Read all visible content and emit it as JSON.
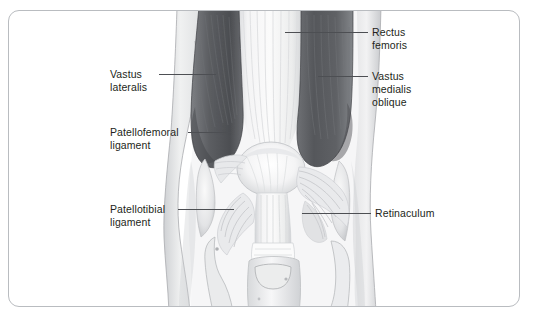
{
  "figure": {
    "kind": "anatomy-illustration",
    "frame_border_color": "#b9bcc0",
    "background_color": "#ffffff",
    "label_text_color": "#231f20",
    "leader_line_color": "#4d4f53",
    "muscle_dark_color": "#5e6064",
    "muscle_mid_color": "#8e9195",
    "tendon_light_color": "#f2f2f2",
    "shade_color": "#c8cacd"
  },
  "labels": {
    "left": [
      {
        "id": "vastus-lateralis",
        "text": "Vastus\nlateralis"
      },
      {
        "id": "patellofemoral-ligament",
        "text": "Patellofemoral\nligament"
      },
      {
        "id": "patellotibial-ligament",
        "text": "Patellotibial\nligament"
      }
    ],
    "right": [
      {
        "id": "rectus-femoris",
        "text": "Rectus\nfemoris"
      },
      {
        "id": "vastus-medialis-oblique",
        "text": "Vastus\nmedialis\noblique"
      },
      {
        "id": "retinaculum",
        "text": "Retinaculum"
      }
    ]
  }
}
